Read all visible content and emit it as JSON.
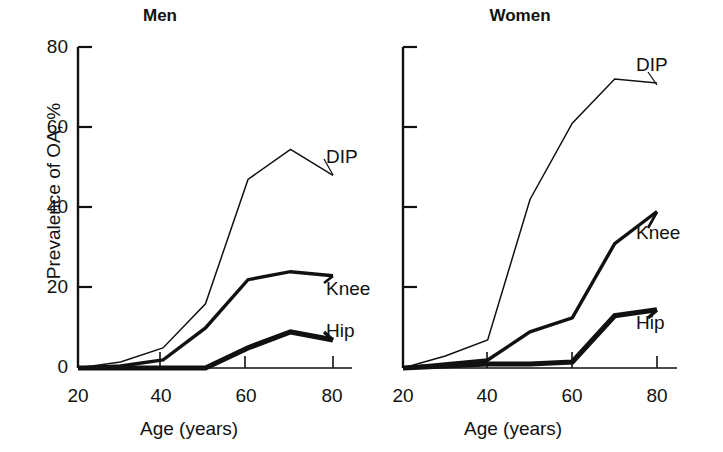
{
  "figure": {
    "ylabel": "Prevalence of OA, %",
    "xlabel_men": "Age (years)",
    "xlabel_women": "Age (years)",
    "panels": [
      {
        "key": "men",
        "title": "Men"
      },
      {
        "key": "women",
        "title": "Women"
      }
    ],
    "y_ticks": [
      "0",
      "20",
      "40",
      "60",
      "80"
    ],
    "x_ticks": [
      "20",
      "40",
      "60",
      "80"
    ],
    "series_labels": {
      "dip": "DIP",
      "knee": "Knee",
      "hip": "Hip"
    },
    "line_color": "#111111"
  },
  "chart_data": [
    {
      "type": "line",
      "title": "Men",
      "xlabel": "Age (years)",
      "ylabel": "Prevalence of OA, %",
      "xlim": [
        20,
        80
      ],
      "ylim": [
        0,
        80
      ],
      "xticks": [
        20,
        40,
        60,
        80
      ],
      "yticks": [
        0,
        20,
        40,
        60,
        80
      ],
      "grid": false,
      "legend_position": "right-of-line-ends",
      "x": [
        20,
        30,
        40,
        50,
        60,
        70,
        80
      ],
      "series": [
        {
          "name": "DIP",
          "values": [
            0,
            1.5,
            5,
            16,
            47,
            54.5,
            48
          ],
          "linewidth": "thin"
        },
        {
          "name": "Knee",
          "values": [
            0,
            0.5,
            2,
            10,
            22,
            24,
            23
          ],
          "linewidth": "medium"
        },
        {
          "name": "Hip",
          "values": [
            0,
            0,
            0,
            0,
            5,
            9,
            7
          ],
          "linewidth": "thick"
        }
      ]
    },
    {
      "type": "line",
      "title": "Women",
      "xlabel": "Age (years)",
      "ylabel": "Prevalence of OA, %",
      "xlim": [
        20,
        80
      ],
      "ylim": [
        0,
        80
      ],
      "xticks": [
        20,
        40,
        60,
        80
      ],
      "yticks": [
        0,
        20,
        40,
        60,
        80
      ],
      "grid": false,
      "legend_position": "right-of-line-ends",
      "x": [
        20,
        30,
        40,
        50,
        60,
        70,
        80
      ],
      "series": [
        {
          "name": "DIP",
          "values": [
            0,
            3,
            7,
            42,
            61,
            72,
            71
          ],
          "linewidth": "thin"
        },
        {
          "name": "Knee",
          "values": [
            0,
            1,
            2,
            9,
            12.5,
            31,
            39
          ],
          "linewidth": "medium"
        },
        {
          "name": "Hip",
          "values": [
            0,
            0.5,
            1,
            1,
            1.5,
            13,
            14.5
          ],
          "linewidth": "thick"
        }
      ]
    }
  ]
}
